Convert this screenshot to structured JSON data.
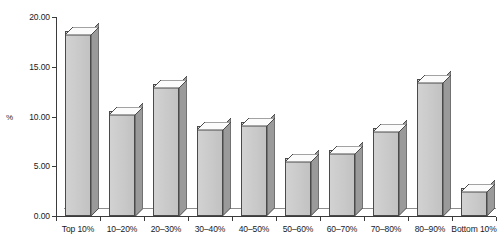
{
  "chart_data": {
    "type": "bar",
    "title": "",
    "xlabel": "",
    "ylabel": "%",
    "categories": [
      "Top 10%",
      "10–20%",
      "20–30%",
      "30–40%",
      "40–50%",
      "50–60%",
      "60–70%",
      "70–80%",
      "80–90%",
      "Bottom 10%"
    ],
    "values": [
      18.6,
      10.6,
      13.3,
      9.0,
      9.4,
      5.8,
      6.6,
      8.8,
      13.8,
      2.8
    ],
    "ylim": [
      0,
      20
    ],
    "yticks": [
      0,
      5,
      10,
      15,
      20
    ],
    "ytick_labels": [
      "0.00",
      "5.00",
      "10.00",
      "15.00",
      "20.00"
    ],
    "grid": false,
    "legend": "none",
    "style": "3d-bar"
  },
  "axis": {
    "y_title": "%"
  },
  "colors": {
    "bar_face": "#cbcbcb",
    "bar_side": "#9a9a9a",
    "bar_top": "#fbfbfb",
    "outline": "#4a4a4a",
    "axis": "#3b3b3b",
    "background": "#ffffff"
  }
}
